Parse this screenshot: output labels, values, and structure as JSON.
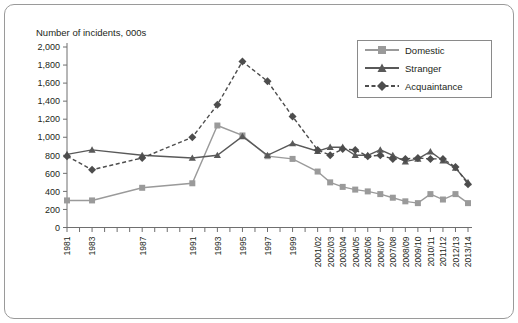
{
  "chart_data": {
    "type": "line",
    "title": "Number of incidents, 000s",
    "xlabel": "",
    "ylabel": "Number of incidents, 000s",
    "ylim": [
      0,
      2000
    ],
    "ytick_step": 200,
    "yticks": [
      "0",
      "200",
      "400",
      "600",
      "800",
      "1,000",
      "1,200",
      "1,400",
      "1,600",
      "1,800",
      "2,000"
    ],
    "grid": false,
    "legend_position": "top-right",
    "categories": [
      "1981",
      "1982",
      "1983",
      "1984",
      "1985",
      "1986",
      "1987",
      "1988",
      "1989",
      "1990",
      "1991",
      "1992",
      "1993",
      "1994",
      "1995",
      "1996",
      "1997",
      "1998",
      "1999",
      "2000",
      "2001/02",
      "2002/03",
      "2003/04",
      "2004/05",
      "2005/06",
      "2006/07",
      "2007/08",
      "2008/09",
      "2009/10",
      "2010/11",
      "2011/12",
      "2012/13",
      "2013/14"
    ],
    "tick_labels": [
      "1981",
      "",
      "1983",
      "",
      "",
      "",
      "1987",
      "",
      "",
      "",
      "1991",
      "",
      "1993",
      "",
      "1995",
      "",
      "1997",
      "",
      "1999",
      "",
      "2001/02",
      "2002/03",
      "2003/04",
      "2004/05",
      "2005/06",
      "2006/07",
      "2007/08",
      "2008/09",
      "2009/10",
      "2010/11",
      "2011/12",
      "2012/13",
      "2013/14"
    ],
    "series": [
      {
        "name": "Domestic",
        "color": "#9a9a9a",
        "marker": "square",
        "dash": "solid",
        "points": [
          {
            "x": "1981",
            "y": 300
          },
          {
            "x": "1983",
            "y": 300
          },
          {
            "x": "1987",
            "y": 440
          },
          {
            "x": "1991",
            "y": 490
          },
          {
            "x": "1993",
            "y": 1130
          },
          {
            "x": "1995",
            "y": 1020
          },
          {
            "x": "1997",
            "y": 790
          },
          {
            "x": "1999",
            "y": 760
          },
          {
            "x": "2001/02",
            "y": 620
          },
          {
            "x": "2002/03",
            "y": 500
          },
          {
            "x": "2003/04",
            "y": 450
          },
          {
            "x": "2004/05",
            "y": 420
          },
          {
            "x": "2005/06",
            "y": 400
          },
          {
            "x": "2006/07",
            "y": 370
          },
          {
            "x": "2007/08",
            "y": 330
          },
          {
            "x": "2008/09",
            "y": 290
          },
          {
            "x": "2009/10",
            "y": 270
          },
          {
            "x": "2010/11",
            "y": 370
          },
          {
            "x": "2011/12",
            "y": 310
          },
          {
            "x": "2012/13",
            "y": 370
          },
          {
            "x": "2013/14",
            "y": 270
          }
        ]
      },
      {
        "name": "Stranger",
        "color": "#595959",
        "marker": "triangle",
        "dash": "solid",
        "points": [
          {
            "x": "1981",
            "y": 810
          },
          {
            "x": "1983",
            "y": 860
          },
          {
            "x": "1987",
            "y": 800
          },
          {
            "x": "1991",
            "y": 770
          },
          {
            "x": "1993",
            "y": 800
          },
          {
            "x": "1995",
            "y": 1010
          },
          {
            "x": "1997",
            "y": 800
          },
          {
            "x": "1999",
            "y": 930
          },
          {
            "x": "2001/02",
            "y": 845
          },
          {
            "x": "2002/03",
            "y": 890
          },
          {
            "x": "2003/04",
            "y": 890
          },
          {
            "x": "2004/05",
            "y": 800
          },
          {
            "x": "2005/06",
            "y": 800
          },
          {
            "x": "2006/07",
            "y": 860
          },
          {
            "x": "2007/08",
            "y": 800
          },
          {
            "x": "2008/09",
            "y": 730
          },
          {
            "x": "2009/10",
            "y": 760
          },
          {
            "x": "2010/11",
            "y": 840
          },
          {
            "x": "2011/12",
            "y": 740
          },
          {
            "x": "2012/13",
            "y": 660
          },
          {
            "x": "2013/14",
            "y": 500
          }
        ]
      },
      {
        "name": "Acquaintance",
        "color": "#4d4d4d",
        "marker": "diamond",
        "dash": "dashed",
        "points": [
          {
            "x": "1981",
            "y": 790
          },
          {
            "x": "1983",
            "y": 640
          },
          {
            "x": "1987",
            "y": 770
          },
          {
            "x": "1991",
            "y": 1000
          },
          {
            "x": "1993",
            "y": 1360
          },
          {
            "x": "1995",
            "y": 1840
          },
          {
            "x": "1997",
            "y": 1620
          },
          {
            "x": "1999",
            "y": 1230
          },
          {
            "x": "2001/02",
            "y": 860
          },
          {
            "x": "2002/03",
            "y": 800
          },
          {
            "x": "2003/04",
            "y": 870
          },
          {
            "x": "2004/05",
            "y": 860
          },
          {
            "x": "2005/06",
            "y": 790
          },
          {
            "x": "2006/07",
            "y": 800
          },
          {
            "x": "2007/08",
            "y": 760
          },
          {
            "x": "2008/09",
            "y": 760
          },
          {
            "x": "2009/10",
            "y": 770
          },
          {
            "x": "2010/11",
            "y": 760
          },
          {
            "x": "2011/12",
            "y": 760
          },
          {
            "x": "2012/13",
            "y": 670
          },
          {
            "x": "2013/14",
            "y": 480
          }
        ]
      }
    ]
  },
  "legend": {
    "items": [
      {
        "label": "Domestic"
      },
      {
        "label": "Stranger"
      },
      {
        "label": "Acquaintance"
      }
    ]
  }
}
